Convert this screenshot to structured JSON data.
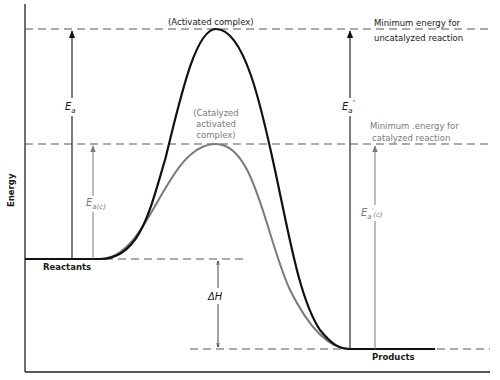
{
  "diagram": {
    "type": "energy-profile",
    "colors": {
      "uncatalyzed": "#111111",
      "catalyzed": "#7a7a7a",
      "axis": "#222222",
      "dashed": "#444444"
    },
    "axis": {
      "ylabel": "Energy",
      "xlabel": ""
    },
    "labels": {
      "activated_complex": "(Activated complex)",
      "catalyzed_complex_line1": "(Catalyzed",
      "catalyzed_complex_line2": "activated",
      "catalyzed_complex_line3": "complex)",
      "min_uncat_line1": "Minimum energy for",
      "min_uncat_line2": "uncatalyzed reaction",
      "min_cat_line1": "Minimum .energy for",
      "min_cat_line2": "catalyzed reaction",
      "reactants": "Reactants",
      "products": "Products"
    },
    "symbols": {
      "ea": "E",
      "ea_sub": "a",
      "ea_c": "E",
      "ea_c_sub": "a(c)",
      "ea_prime": "E",
      "ea_prime_sub": "a",
      "ea_prime_mark": "′",
      "ea_prime_c": "E",
      "ea_prime_c_sub": "a",
      "ea_prime_c_mark": "′",
      "ea_prime_c_sub2": "(c)",
      "delta_h": "ΔH"
    },
    "levels": {
      "uncatalyzed_peak_y": 29,
      "catalyzed_peak_y": 144,
      "reactants_y": 259,
      "products_y": 349
    }
  }
}
